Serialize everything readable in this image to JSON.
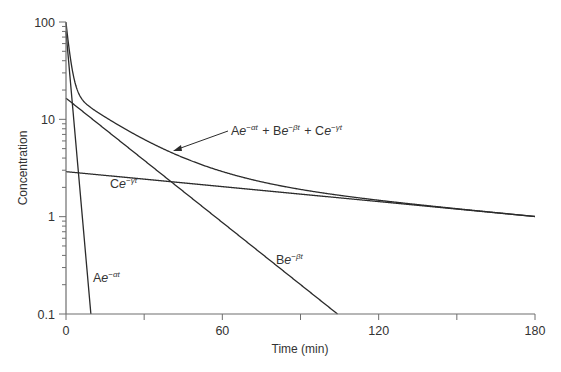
{
  "chart_data": {
    "type": "line",
    "title": "",
    "xlabel": "Time (min)",
    "ylabel": "Concentration",
    "xscale": "linear",
    "yscale": "log",
    "xlim": [
      0,
      180
    ],
    "ylim": [
      0.1,
      100
    ],
    "x_ticks": [
      0,
      30,
      60,
      90,
      120,
      150,
      180
    ],
    "x_tick_labels": [
      "0",
      "",
      "60",
      "",
      "120",
      "",
      "180"
    ],
    "y_tick_labels": [
      "0.1",
      "1",
      "10",
      "100"
    ],
    "y_tick_values": [
      0.1,
      1,
      10,
      100
    ],
    "grid": false,
    "legend": "none (inline annotations)",
    "parameters": {
      "A": 80,
      "alpha": 0.7,
      "B": 16.5,
      "beta": 0.049,
      "C": 2.9,
      "gamma": 0.0059
    },
    "series": [
      {
        "name": "Ae^{-αt}",
        "label_parts": [
          "A",
          "e",
          "−αt"
        ],
        "x": [
          0,
          2,
          4,
          6,
          8,
          9.6
        ],
        "values": [
          80,
          19.7,
          4.9,
          1.2,
          0.3,
          0.1
        ]
      },
      {
        "name": "Be^{-βt}",
        "label_parts": [
          "B",
          "e",
          "−βt"
        ],
        "x": [
          0,
          20,
          40,
          60,
          80,
          104
        ],
        "values": [
          16.5,
          6.1,
          2.3,
          0.87,
          0.33,
          0.1
        ]
      },
      {
        "name": "Ce^{-γt}",
        "label_parts": [
          "C",
          "e",
          "−γt"
        ],
        "x": [
          0,
          30,
          60,
          90,
          120,
          150,
          180
        ],
        "values": [
          2.9,
          2.43,
          2.04,
          1.71,
          1.43,
          1.2,
          1.0
        ]
      },
      {
        "name": "Ae^{-αt} + Be^{-βt} + Ce^{-γt}",
        "label_parts": [
          "A",
          "e",
          "−αt",
          " + B",
          "e",
          "−βt",
          " + C",
          "e",
          "−γt"
        ],
        "x": [
          0,
          5,
          10,
          20,
          40,
          60,
          90,
          120,
          150,
          180
        ],
        "values": [
          99.4,
          16.9,
          13.3,
          8.5,
          4.6,
          2.9,
          1.9,
          1.48,
          1.21,
          1.0
        ]
      }
    ],
    "annotations": [
      {
        "text": "Ae^{-αt} + Be^{-βt} + Ce^{-γt}",
        "arrow_to": [
          42,
          4.9
        ]
      },
      {
        "text": "Ce^{-γt}",
        "at": [
          14,
          2.0
        ]
      },
      {
        "text": "Be^{-βt}",
        "at": [
          80,
          0.55
        ]
      },
      {
        "text": "Ae^{-αt}",
        "at": [
          8,
          0.18
        ]
      }
    ]
  }
}
